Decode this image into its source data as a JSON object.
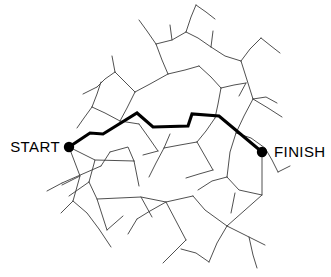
{
  "figure": {
    "type": "maze-puzzle",
    "width": 331,
    "height": 277,
    "background_color": "#ffffff"
  },
  "labels": {
    "start": "START",
    "finish": "FINISH"
  },
  "colors": {
    "wall_stroke": "#3c3c3c",
    "solution_stroke": "#000000",
    "dot_fill": "#000000",
    "background": "#ffffff"
  },
  "endpoints": {
    "start": {
      "name": "start-point",
      "x": 69,
      "y": 147,
      "radius": 5.2,
      "label_x": 60,
      "label_y": 152
    },
    "finish": {
      "name": "finish-point",
      "x": 262,
      "y": 152,
      "radius": 5.2,
      "label_x": 274,
      "label_y": 157
    }
  },
  "solution": {
    "stroke_width": 3.1,
    "points": "69,147 90,133 103,134 137,113 153,127 188,126 192,114 219,116 262,152"
  },
  "walls": [
    "69,147 80,176 73,201 61,213",
    "69,147 95,160 89,182",
    "95,160 134,161",
    "89,182 97,199 107,230",
    "73,201 87,213 99,229 111,247",
    "80,176 62,185",
    "89,182 69,196",
    "134,161 128,147 110,152",
    "134,161 139,186",
    "110,152 101,166",
    "101,166 62,183",
    "62,183 47,191",
    "97,199 141,197 166,202 193,196",
    "141,197 152,217",
    "193,196 205,210 227,226",
    "166,202 176,221 186,240",
    "107,230 123,216",
    "227,226 262,195 262,152",
    "227,226 217,243 209,262",
    "227,226 249,237 265,245",
    "209,262 196,253 181,249",
    "262,195 239,190 227,177",
    "227,177 212,181 198,190",
    "227,177 230,152 236,133",
    "236,133 251,138 265,148",
    "236,133 244,116 253,99",
    "253,99 266,97 277,103",
    "253,99 247,80 241,61",
    "241,61 250,49 261,38",
    "241,61 225,56 211,47",
    "211,47 198,38 186,32",
    "186,32 191,17 196,5",
    "186,32 172,40 156,44",
    "156,44 147,31 139,20",
    "156,44 162,60 168,74",
    "168,74 185,70 199,66",
    "199,66 211,77 221,88",
    "221,88 234,85 246,83",
    "221,88 218,104 215,118",
    "168,74 150,84 135,92",
    "135,92 124,81 115,72",
    "115,72 105,79 97,87",
    "135,92 127,108 120,121",
    "120,121 105,113 92,107",
    "92,107 84,118 77,128",
    "92,107 97,94 101,82",
    "120,121 139,124",
    "215,118 206,131 197,142",
    "197,142 180,145 164,148",
    "164,148 156,163 149,177",
    "164,148 170,134",
    "197,142 205,156 213,170",
    "213,170 199,174 186,178",
    "139,124 149,138 158,151",
    "158,151 143,155",
    "253,99 268,108 282,117",
    "196,5 206,12 215,19",
    "261,38 271,46 280,53",
    "246,83 239,96",
    "265,148 272,160 278,172",
    "278,172 290,166",
    "166,202 150,211 137,219",
    "137,219 128,234",
    "186,240 174,252 163,263",
    "249,237 253,255 257,268",
    "115,72 112,56",
    "97,87 83,94",
    "211,47 213,31",
    "172,40 170,25",
    "235,193 231,213"
  ]
}
